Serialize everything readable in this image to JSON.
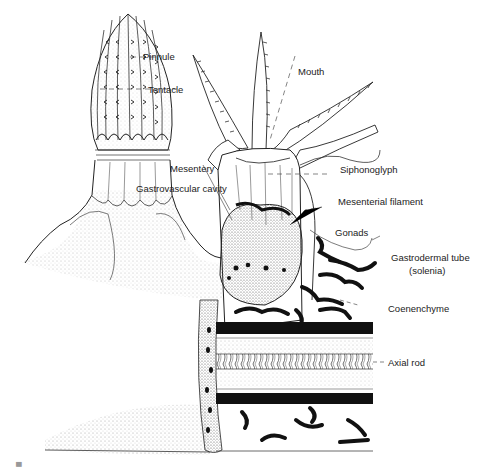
{
  "figure": {
    "labels": {
      "pinnule": "Pinnule",
      "tentacle": "Tentacle",
      "mouth": "Mouth",
      "siphonoglyph": "Siphonoglyph",
      "mesentery": "Mesentery",
      "gastrovascular_cavity": "Gastrovascular cavity",
      "mesenterial_filament": "Mesenterial filament",
      "gonads": "Gonads",
      "gastrodermal_tube": "Gastrodermal tube",
      "gastrodermal_tube_sub": "(solenia)",
      "coenenchyme": "Coenenchyme",
      "axial_rod": "Axial rod"
    },
    "caption": "Figure"
  },
  "colors": {
    "ink": "#1a1a1a",
    "stipple": "#8a8a8a",
    "background": "#ffffff",
    "label": "#222222"
  }
}
